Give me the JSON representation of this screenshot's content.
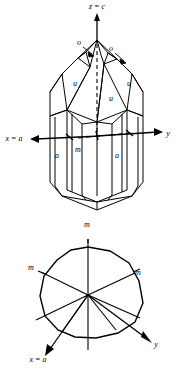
{
  "figure": {
    "kind": "crystal-morphology-diagram",
    "background_color": "#ffffff",
    "line_color": "#000000"
  },
  "upper_diagram": {
    "name": "quartz-crystal-perspective-view",
    "axes": [
      {
        "id": "z",
        "label": "z = c",
        "direction": "up",
        "label_x": 97,
        "label_y": 9
      },
      {
        "id": "x",
        "label": "x = a",
        "direction": "left",
        "label_x": 14,
        "label_y": 141
      },
      {
        "id": "y",
        "label": "y",
        "direction": "right",
        "label_x": 168,
        "label_y": 136
      }
    ],
    "face_labels": [
      {
        "text": "o",
        "x": 79,
        "y": 45
      },
      {
        "text": "o",
        "x": 111,
        "y": 51
      },
      {
        "text": "u",
        "x": 75,
        "y": 86
      },
      {
        "text": "u",
        "x": 129,
        "y": 86
      },
      {
        "text": "u",
        "x": 111,
        "y": 101
      },
      {
        "text": "m",
        "x": 78,
        "y": 152
      },
      {
        "text": "a",
        "x": 57,
        "y": 158
      },
      {
        "text": "a",
        "x": 117,
        "y": 158
      }
    ]
  },
  "lower_diagram": {
    "name": "basal-section-view",
    "axes": [
      {
        "id": "x",
        "label": "x = a",
        "direction": "lower-left",
        "label_x": 38,
        "label_y": 362
      },
      {
        "id": "y",
        "label": "y",
        "direction": "lower-right",
        "label_x": 156,
        "label_y": 347
      }
    ],
    "face_labels": [
      {
        "text": "m",
        "x": 87,
        "y": 227
      },
      {
        "text": "m",
        "x": 31,
        "y": 270
      },
      {
        "text": "m",
        "x": 138,
        "y": 275
      }
    ]
  }
}
